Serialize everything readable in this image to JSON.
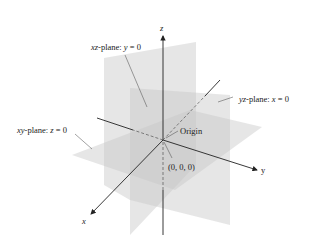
{
  "diagram": {
    "axes": {
      "x": {
        "label": "x"
      },
      "y": {
        "label": "y"
      },
      "z": {
        "label": "z"
      }
    },
    "planes": [
      {
        "id": "xz",
        "name": "xz",
        "suffix": "-plane: ",
        "eq_var": "y",
        "eq_rest": " = 0"
      },
      {
        "id": "yz",
        "name": "yz",
        "suffix": "-plane: ",
        "eq_var": "x",
        "eq_rest": " = 0"
      },
      {
        "id": "xy",
        "name": "xy",
        "suffix": "-plane: ",
        "eq_var": "z",
        "eq_rest": " = 0"
      }
    ],
    "origin": {
      "label": "Origin",
      "coords": "(0, 0, 0)"
    },
    "colors": {
      "plane_fill": "#c8c8c8",
      "axis": "#222222",
      "background": "#ffffff"
    }
  }
}
